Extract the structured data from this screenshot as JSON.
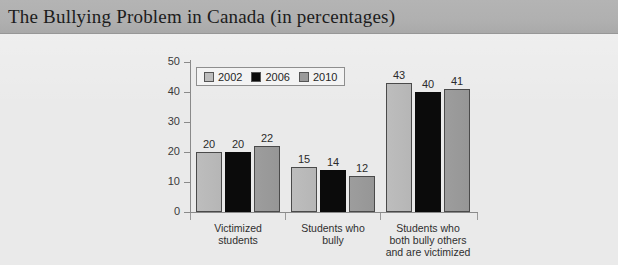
{
  "header": {
    "title": "The Bullying Problem in Canada (in percentages)"
  },
  "colors": {
    "header_band": "#b0b0b0",
    "page_background": "#eaeaea",
    "series_2002": "#bdbdbd",
    "series_2006": "#0b0b0b",
    "series_2010": "#9a9a9a",
    "axis": "#8a8a8a",
    "text": "#2b2b2b"
  },
  "chart_data": {
    "type": "bar",
    "title": "The Bullying Problem in Canada (in percentages)",
    "xlabel": "",
    "ylabel": "",
    "ylim": [
      0,
      50
    ],
    "yticks": [
      0,
      10,
      20,
      30,
      40,
      50
    ],
    "ytick_labels": [
      "0",
      "10",
      "20",
      "30",
      "40",
      "50"
    ],
    "grid": false,
    "legend_position": "top-left-inside",
    "categories": [
      "Victimized students",
      "Students who bully",
      "Students who both bully others and are victimized"
    ],
    "category_lines": [
      [
        "Victimized",
        "students"
      ],
      [
        "Students who",
        "bully"
      ],
      [
        "Students who",
        "both bully others",
        "and are victimized"
      ]
    ],
    "series": [
      {
        "name": "2002",
        "values": [
          20,
          15,
          43
        ]
      },
      {
        "name": "2006",
        "values": [
          20,
          14,
          40
        ]
      },
      {
        "name": "2010",
        "values": [
          22,
          12,
          41
        ]
      }
    ],
    "value_labels": [
      [
        "20",
        "20",
        "22"
      ],
      [
        "15",
        "14",
        "12"
      ],
      [
        "43",
        "40",
        "41"
      ]
    ]
  }
}
